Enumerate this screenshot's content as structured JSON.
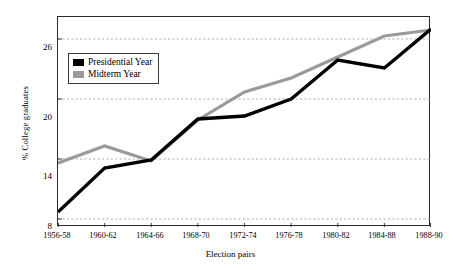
{
  "chart_data": {
    "type": "line",
    "title": "",
    "xlabel": "Election pairs",
    "ylabel": "% College graduates",
    "categories": [
      "1956-58",
      "1960-62",
      "1964-66",
      "1968-70",
      "1972-74",
      "1976-78",
      "1980-82",
      "1984-88",
      "1988-90"
    ],
    "yticks": [
      8,
      14,
      20,
      26
    ],
    "ylim": [
      7.2,
      28.2
    ],
    "grid": "horizontal-dashed",
    "legend_position": "upper-left-inside",
    "series": [
      {
        "name": "Presidential Year",
        "color": "#000000",
        "values": [
          8.7,
          13.1,
          13.9,
          18.0,
          18.3,
          20.0,
          23.9,
          23.1,
          27.0
        ]
      },
      {
        "name": "Midterm Year",
        "color": "#9a9a9a",
        "values": [
          13.6,
          15.3,
          13.8,
          17.9,
          20.7,
          22.1,
          24.2,
          26.3,
          26.9
        ]
      }
    ]
  },
  "legend": {
    "items": [
      {
        "label": "Presidential Year",
        "color": "#000000",
        "swatch": "black-line-swatch"
      },
      {
        "label": "Midterm Year",
        "color": "#9a9a9a",
        "swatch": "gray-line-swatch"
      }
    ]
  },
  "axes": {
    "y_title": "% College graduates",
    "x_title": "Election pairs",
    "y_tick_labels": [
      "26",
      "20",
      "14",
      "8"
    ],
    "x_tick_labels": [
      "1956-58",
      "1960-62",
      "1964-66",
      "1968-70",
      "1972-74",
      "1976-78",
      "1980-82",
      "1984-88",
      "1988-90"
    ]
  }
}
